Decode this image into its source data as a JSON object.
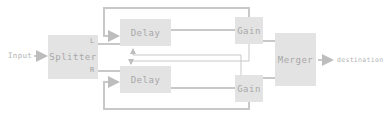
{
  "diagram": {
    "input_label": "Input",
    "output_label": "destination",
    "nodes": {
      "splitter": {
        "label": "Splitter",
        "ports": {
          "left": "L",
          "right": "R"
        }
      },
      "delay_top": {
        "label": "Delay"
      },
      "delay_bottom": {
        "label": "Delay"
      },
      "gain_top": {
        "label": "Gain"
      },
      "gain_bottom": {
        "label": "Gain"
      },
      "merger": {
        "label": "Merger"
      }
    },
    "edges": [
      {
        "from": "Input",
        "to": "Splitter"
      },
      {
        "from": "Splitter.L",
        "to": "Delay (top)"
      },
      {
        "from": "Splitter.R",
        "to": "Delay (bottom)"
      },
      {
        "from": "Delay (top)",
        "to": "Gain (top)"
      },
      {
        "from": "Delay (bottom)",
        "to": "Gain (bottom)"
      },
      {
        "from": "Gain (top)",
        "to": "Delay (top)",
        "type": "feedback"
      },
      {
        "from": "Gain (bottom)",
        "to": "Delay (bottom)",
        "type": "feedback"
      },
      {
        "from": "Gain (top)",
        "to": "Delay (bottom)",
        "type": "cross-feedback"
      },
      {
        "from": "Gain (bottom)",
        "to": "Delay (top)",
        "type": "cross-feedback"
      },
      {
        "from": "Gain (top)",
        "to": "Merger"
      },
      {
        "from": "Gain (bottom)",
        "to": "Merger"
      },
      {
        "from": "Merger",
        "to": "destination"
      }
    ],
    "colors": {
      "box": "#e3e3e3",
      "wire": "#c8c8c8",
      "text": "#a8a8a8"
    }
  }
}
